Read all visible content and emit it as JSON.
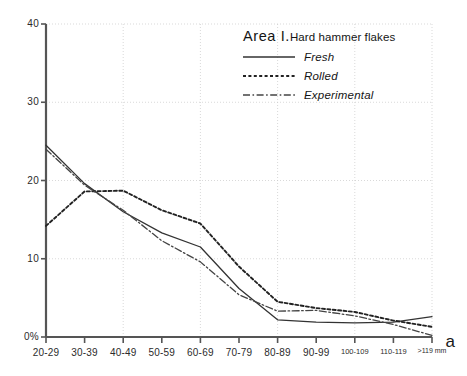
{
  "figure_letter": "a",
  "legend": {
    "area": "Area I.",
    "subject": "Hard hammer flakes",
    "entries": [
      {
        "label": "Fresh",
        "style": "solid",
        "color": "#333333"
      },
      {
        "label": "Rolled",
        "style": "dotted",
        "color": "#222222"
      },
      {
        "label": "Experimental",
        "style": "dashdot",
        "color": "#444444"
      }
    ]
  },
  "axis": {
    "y_tick_labels": [
      "40",
      "30",
      "20",
      "10",
      "0%"
    ],
    "x_tick_labels": [
      "20-29",
      "30-39",
      "40-49",
      "50-59",
      "60-69",
      "70-79",
      "80-89",
      "90-99",
      "100-109",
      "110-119",
      ">119 mm"
    ]
  },
  "chart_data": {
    "type": "line",
    "title": "Area I. Hard hammer flakes",
    "xlabel": "",
    "ylabel": "",
    "ylim": [
      0,
      40
    ],
    "yticks": [
      0,
      10,
      20,
      30,
      40
    ],
    "grid": true,
    "legend_position": "top-right",
    "categories": [
      "20-29",
      "30-39",
      "40-49",
      "50-59",
      "60-69",
      "70-79",
      "80-89",
      "90-99",
      "100-109",
      "110-119",
      ">119 mm"
    ],
    "series": [
      {
        "name": "Fresh",
        "style": "solid",
        "values": [
          24.5,
          19.6,
          16.0,
          13.3,
          11.5,
          6.2,
          2.2,
          1.9,
          1.8,
          1.9,
          2.6
        ]
      },
      {
        "name": "Rolled",
        "style": "dotted",
        "values": [
          14.2,
          18.6,
          18.7,
          16.2,
          14.5,
          9.0,
          4.5,
          3.7,
          3.2,
          2.1,
          1.3
        ]
      },
      {
        "name": "Experimental",
        "style": "dashdot",
        "values": [
          24.0,
          19.4,
          16.2,
          12.3,
          9.6,
          5.4,
          3.3,
          3.4,
          2.7,
          1.6,
          0.2
        ]
      }
    ]
  }
}
